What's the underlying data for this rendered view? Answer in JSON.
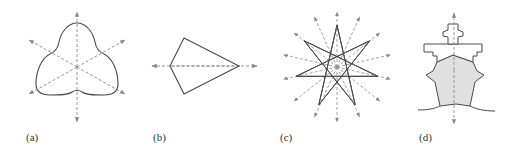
{
  "figure": {
    "panels": [
      {
        "id": "a",
        "label": "(a)",
        "shape": "trefoil-curve",
        "symmetry_axes": 3
      },
      {
        "id": "b",
        "label": "(b)",
        "shape": "kite",
        "symmetry_axes": 1
      },
      {
        "id": "c",
        "label": "(c)",
        "shape": "seven-pointed-star",
        "symmetry_axes": 7
      },
      {
        "id": "d",
        "label": "(d)",
        "shape": "ship-front-view",
        "symmetry_axes": 1
      }
    ],
    "colors": {
      "outline": "#4a4a4a",
      "axis": "#8a8a8a",
      "ship_fill": "#e0e0e0"
    }
  }
}
